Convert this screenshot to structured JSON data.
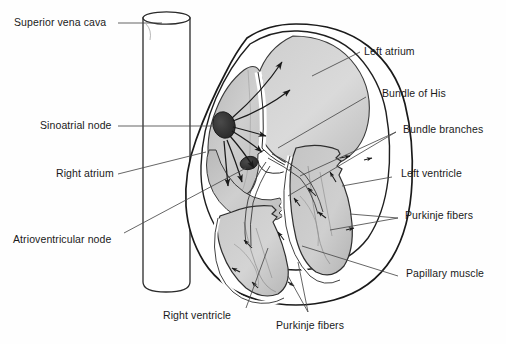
{
  "figure": {
    "background_color": "#fefefe",
    "ink_color": "#1a1a1a",
    "colors": {
      "outline": "#1a1a1a",
      "node_fill": "#2b2b2b",
      "atrium_fill": "#c9c9c9",
      "ventricle_fill": "#c4c4c4",
      "wall_fill": "#ffffff",
      "leader_line": "#555555"
    }
  },
  "labels": {
    "superior_vena_cava": "Superior vena cava",
    "sinoatrial_node": "Sinoatrial node",
    "right_atrium": "Right atrium",
    "atrioventricular_node": "Atrioventricular node",
    "left_atrium": "Left atrium",
    "bundle_of_his": "Bundle of His",
    "bundle_branches": "Bundle branches",
    "left_ventricle": "Left ventricle",
    "purkinje_fibers_right": "Purkinje fibers",
    "papillary_muscle": "Papillary muscle",
    "right_ventricle": "Right ventricle",
    "purkinje_fibers_bottom": "Purkinje fibers"
  },
  "structures": {
    "superior_vena_cava": "vertical vessel cylinder behind the heart",
    "right_atrium": "upper-left chamber containing the sinoatrial node",
    "left_atrium": "upper-right rounded chamber",
    "right_ventricle": "lower-left muscular chamber",
    "left_ventricle": "lower-right muscular chamber",
    "sinoatrial_node": "dark oval pacemaker in right atrial wall",
    "atrioventricular_node": "small dark oval at the atrial septum base",
    "conduction_arrows": "arrows radiating from the sinoatrial node across the atria",
    "purkinje_arrows": "small arrows spreading through ventricular walls"
  }
}
